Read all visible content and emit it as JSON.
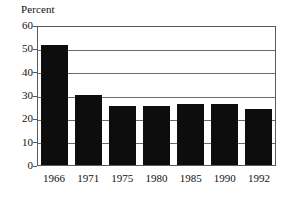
{
  "chart_data": {
    "type": "bar",
    "title": "",
    "subtitle": "",
    "xlabel": "",
    "ylabel": "Percent",
    "categories": [
      "1966",
      "1971",
      "1975",
      "1980",
      "1985",
      "1990",
      "1992"
    ],
    "values": [
      51.5,
      30,
      25.5,
      25.3,
      26,
      26.2,
      24
    ],
    "series": [
      {
        "name": "Percent",
        "values": [
          51.5,
          30,
          25.5,
          25.3,
          26,
          26.2,
          24
        ]
      }
    ],
    "ylim": [
      0,
      60
    ],
    "yticks": [
      0,
      10,
      20,
      30,
      40,
      50,
      60
    ],
    "ytick_labels": [
      "0",
      "10",
      "20",
      "30",
      "40",
      "50",
      "60"
    ],
    "grid": true,
    "grid_axis": "y",
    "legend": false,
    "legend_position": "none",
    "bar_color": "#0d0d0d",
    "grid_color": "#6b6b6b",
    "frame_color": "#5a5a5a",
    "background_color": "#ffffff",
    "annotations": []
  }
}
